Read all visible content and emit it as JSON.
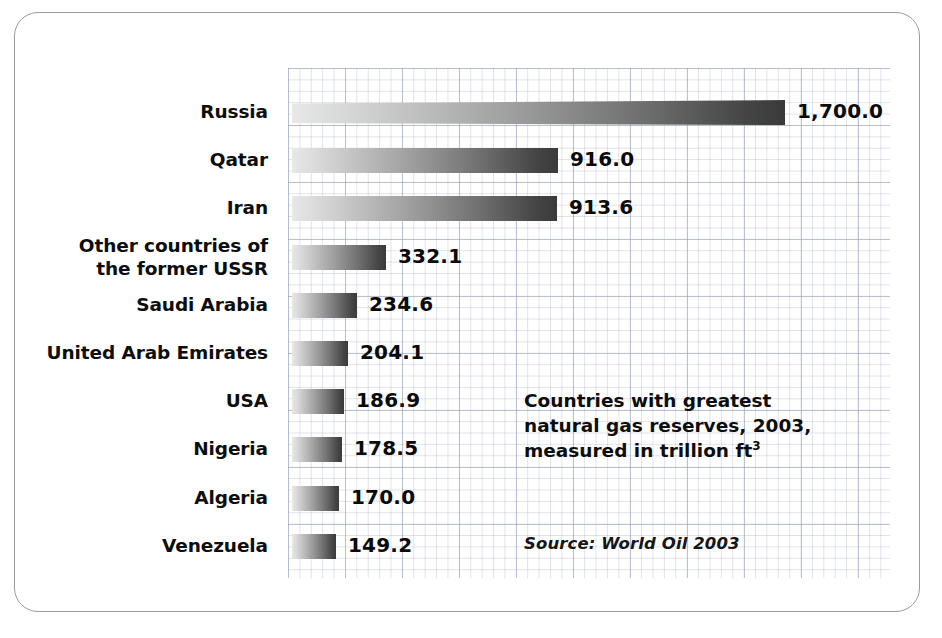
{
  "chart_data": {
    "type": "bar",
    "orientation": "horizontal",
    "title": "Countries with greatest natural gas reserves, 2003, measured in trillion ft3",
    "title_lines": [
      "Countries with greatest",
      "natural gas reserves, 2003,",
      "measured in trillion ft"
    ],
    "title_superscript": "3",
    "source": "Source: World Oil 2003",
    "units": "trillion cubic feet",
    "year": 2003,
    "xlabel": "",
    "ylabel": "",
    "grid": true,
    "legend": "none",
    "xlim": [
      0,
      1700
    ],
    "categories": [
      "Russia",
      "Qatar",
      "Iran",
      "Other countries of the former USSR",
      "Saudi Arabia",
      "United Arab Emirates",
      "USA",
      "Nigeria",
      "Algeria",
      "Venezuela"
    ],
    "values": [
      1700.0,
      916.0,
      913.6,
      332.1,
      234.6,
      204.1,
      186.9,
      178.5,
      170.0,
      149.2
    ],
    "value_labels": [
      "1,700.0",
      "916.0",
      "913.6",
      "332.1",
      "234.6",
      "204.1",
      "186.9",
      "178.5",
      "170.0",
      "149.2"
    ]
  },
  "rows": [
    {
      "label": "Russia",
      "label_lines": [
        "Russia"
      ],
      "value_label": "1,700.0",
      "bar_px": 493,
      "tapered": true
    },
    {
      "label": "Qatar",
      "label_lines": [
        "Qatar"
      ],
      "value_label": "916.0",
      "bar_px": 266,
      "tapered": false
    },
    {
      "label": "Iran",
      "label_lines": [
        "Iran"
      ],
      "value_label": "913.6",
      "bar_px": 265,
      "tapered": false
    },
    {
      "label": "Other countries of the former USSR",
      "label_lines": [
        "Other countries of",
        "the former USSR"
      ],
      "value_label": "332.1",
      "bar_px": 94,
      "tapered": false
    },
    {
      "label": "Saudi Arabia",
      "label_lines": [
        "Saudi Arabia"
      ],
      "value_label": "234.6",
      "bar_px": 65,
      "tapered": false
    },
    {
      "label": "United Arab Emirates",
      "label_lines": [
        "United Arab Emirates"
      ],
      "value_label": "204.1",
      "bar_px": 56,
      "tapered": false
    },
    {
      "label": "USA",
      "label_lines": [
        "USA"
      ],
      "value_label": "186.9",
      "bar_px": 52,
      "tapered": false
    },
    {
      "label": "Nigeria",
      "label_lines": [
        "Nigeria"
      ],
      "value_label": "178.5",
      "bar_px": 50,
      "tapered": false
    },
    {
      "label": "Algeria",
      "label_lines": [
        "Algeria"
      ],
      "value_label": "170.0",
      "bar_px": 47,
      "tapered": false
    },
    {
      "label": "Venezuela",
      "label_lines": [
        "Venezuela"
      ],
      "value_label": "149.2",
      "bar_px": 44,
      "tapered": false
    }
  ],
  "colors": {
    "bar_light": "#e8e8e8",
    "bar_dark": "#3a3a3a",
    "text": "#0d0d0d",
    "frame_border": "#9b9b9b",
    "grid_line": "#8c96b4",
    "background": "#ffffff"
  }
}
